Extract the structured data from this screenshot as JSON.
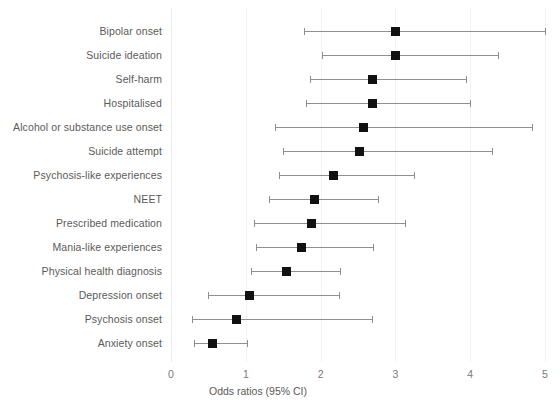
{
  "chart_data": {
    "type": "scatter",
    "subtype": "forest-plot",
    "title": "",
    "xlabel": "Odds ratios (95% CI)",
    "ylabel": "",
    "xlim": [
      0,
      5.2
    ],
    "xticks": [
      0,
      1,
      2,
      3,
      4,
      5
    ],
    "xtick_labels": [
      "0",
      "1",
      "2",
      "3",
      "4",
      "5"
    ],
    "grid": true,
    "legend": "none",
    "reference_line": 1,
    "marker_color": "#111111",
    "line_color": "#8f8f8f",
    "categories": [
      "Bipolar onset",
      "Suicide ideation",
      "Self-harm",
      "Hospitalised",
      "Alcohol or substance use onset",
      "Suicide attempt",
      "Psychosis-like experiences",
      "NEET",
      "Prescribed medication",
      "Mania-like experiences",
      "Physical health diagnosis",
      "Depression onset",
      "Psychosis onset",
      "Anxiety onset"
    ],
    "values": [
      3.0,
      3.0,
      2.7,
      2.7,
      2.57,
      2.52,
      2.17,
      1.92,
      1.88,
      1.74,
      1.54,
      1.05,
      0.88,
      0.55
    ],
    "ci_low": [
      1.78,
      2.02,
      1.86,
      1.8,
      1.39,
      1.5,
      1.44,
      1.31,
      1.11,
      1.14,
      1.07,
      0.5,
      0.28,
      0.31
    ],
    "ci_high": [
      5.0,
      4.37,
      3.95,
      4.0,
      4.82,
      4.29,
      3.25,
      2.77,
      3.13,
      2.7,
      2.26,
      2.25,
      2.69,
      1.02
    ],
    "points": [
      {
        "label": "Bipolar onset",
        "or": 3.0,
        "ci_low": 1.78,
        "ci_high": 5.0
      },
      {
        "label": "Suicide ideation",
        "or": 3.0,
        "ci_low": 2.02,
        "ci_high": 4.37
      },
      {
        "label": "Self-harm",
        "or": 2.7,
        "ci_low": 1.86,
        "ci_high": 3.95
      },
      {
        "label": "Hospitalised",
        "or": 2.7,
        "ci_low": 1.8,
        "ci_high": 4.0
      },
      {
        "label": "Alcohol or substance use onset",
        "or": 2.57,
        "ci_low": 1.39,
        "ci_high": 4.82
      },
      {
        "label": "Suicide attempt",
        "or": 2.52,
        "ci_low": 1.5,
        "ci_high": 4.29
      },
      {
        "label": "Psychosis-like experiences",
        "or": 2.17,
        "ci_low": 1.44,
        "ci_high": 3.25
      },
      {
        "label": "NEET",
        "or": 1.92,
        "ci_low": 1.31,
        "ci_high": 2.77
      },
      {
        "label": "Prescribed medication",
        "or": 1.88,
        "ci_low": 1.11,
        "ci_high": 3.13
      },
      {
        "label": "Mania-like experiences",
        "or": 1.74,
        "ci_low": 1.14,
        "ci_high": 2.7
      },
      {
        "label": "Physical health diagnosis",
        "or": 1.54,
        "ci_low": 1.07,
        "ci_high": 2.26
      },
      {
        "label": "Depression onset",
        "or": 1.05,
        "ci_low": 0.5,
        "ci_high": 2.25
      },
      {
        "label": "Psychosis onset",
        "or": 0.88,
        "ci_low": 0.28,
        "ci_high": 2.69
      },
      {
        "label": "Anxiety onset",
        "or": 0.55,
        "ci_low": 0.31,
        "ci_high": 1.02
      }
    ]
  }
}
